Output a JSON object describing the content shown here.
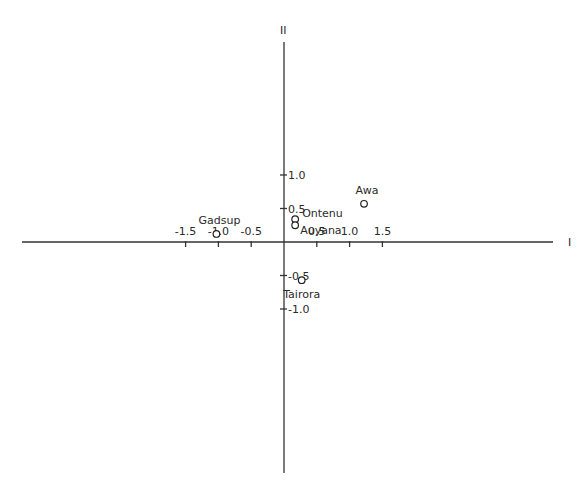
{
  "chart_data": {
    "type": "scatter",
    "title": "",
    "xlabel": "I",
    "ylabel": "II",
    "xlim": [
      -1.95,
      2.05
    ],
    "ylim": [
      -1.72,
      1.5
    ],
    "grid": false,
    "legend": null,
    "x_ticks": [
      {
        "value": -1.5,
        "label": "-1.5"
      },
      {
        "value": -1.0,
        "label": "-1.0"
      },
      {
        "value": -0.5,
        "label": "-0.5"
      },
      {
        "value": 0.5,
        "label": "0.5"
      },
      {
        "value": 1.0,
        "label": "1.0"
      },
      {
        "value": 1.5,
        "label": "1.5"
      }
    ],
    "y_ticks": [
      {
        "value": 1.0,
        "label": "1.0"
      },
      {
        "value": 0.5,
        "label": "0.5"
      },
      {
        "value": -0.5,
        "label": "-0.5"
      },
      {
        "value": -1.0,
        "label": "-1.0"
      }
    ],
    "points": [
      {
        "label": "Gadsup",
        "x": -1.03,
        "y": 0.12,
        "label_pos": "above"
      },
      {
        "label": "Ontenu",
        "x": 0.17,
        "y": 0.34,
        "label_pos": "right-up"
      },
      {
        "label": "Auyana",
        "x": 0.17,
        "y": 0.25,
        "label_pos": "right-down"
      },
      {
        "label": "Awa",
        "x": 1.22,
        "y": 0.57,
        "label_pos": "above"
      },
      {
        "label": "Tairora",
        "x": 0.27,
        "y": -0.57,
        "label_pos": "below"
      }
    ]
  },
  "layout": {
    "origin_px": [
      284,
      242
    ],
    "x_px_per_unit": 65.6,
    "y_px_per_unit": 67.0,
    "x_axis_px": [
      22,
      553
    ],
    "y_axis_px": [
      42,
      473
    ]
  }
}
